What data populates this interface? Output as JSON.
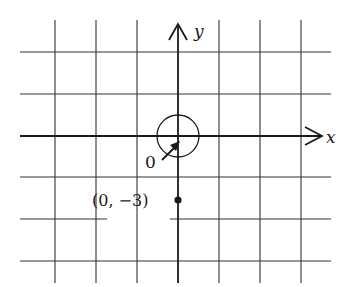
{
  "diagram": {
    "type": "coordinate-plane",
    "axes": {
      "x_label": "x",
      "y_label": "y"
    },
    "origin_label": "0",
    "point": {
      "label": "(0, −3)",
      "x": 0,
      "y": -3
    },
    "grid": {
      "spacing_units": 1,
      "vertical_lines_px": [
        55,
        96,
        137,
        178,
        219,
        260,
        301
      ],
      "horizontal_lines_px": [
        52,
        94,
        136,
        177,
        219,
        261
      ]
    },
    "colors": {
      "ink": "#1a1a1a",
      "grid": "#333333",
      "background": "#ffffff"
    }
  }
}
